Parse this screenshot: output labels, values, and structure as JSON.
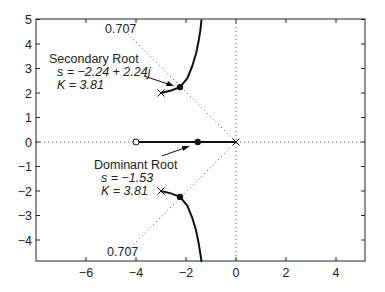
{
  "chart_data": {
    "type": "line",
    "title": "",
    "xlabel": "",
    "ylabel": "",
    "xlim": [
      -8,
      5.2
    ],
    "ylim": [
      -4.9,
      5
    ],
    "grid": false,
    "x_ticks": [
      -6,
      -4,
      -2,
      0,
      2,
      4
    ],
    "x_tick_labels": [
      "−6",
      "−4",
      "−2",
      "0",
      "2",
      "4"
    ],
    "y_ticks": [
      5,
      4,
      3,
      2,
      1,
      0,
      -1,
      -2,
      -3,
      -4
    ],
    "y_tick_labels": [
      "5",
      "4",
      "3",
      "2",
      "1",
      "0",
      "−1",
      "−2",
      "−3",
      "−4"
    ],
    "poles": [
      [
        0,
        0
      ],
      [
        -3,
        2
      ],
      [
        -3,
        -2
      ]
    ],
    "zeros": [
      [
        -4,
        0
      ]
    ],
    "series": [
      {
        "name": "real-axis locus",
        "x": [
          -4,
          0
        ],
        "y": [
          0,
          0
        ]
      },
      {
        "name": "upper complex branch",
        "x": [
          -3.0,
          -2.6,
          -2.24,
          -1.95,
          -1.75,
          -1.6,
          -1.5,
          -1.42,
          -1.38
        ],
        "y": [
          2.0,
          2.1,
          2.24,
          2.6,
          3.1,
          3.6,
          4.1,
          4.6,
          5.0
        ]
      },
      {
        "name": "lower complex branch",
        "x": [
          -3.0,
          -2.6,
          -2.24,
          -1.95,
          -1.75,
          -1.6,
          -1.5,
          -1.42,
          -1.38
        ],
        "y": [
          -2.0,
          -2.1,
          -2.24,
          -2.6,
          -3.1,
          -3.6,
          -4.1,
          -4.6,
          -4.9
        ]
      }
    ],
    "damping_lines": {
      "zeta": 0.707,
      "label": "0.707"
    },
    "marked_roots": [
      [
        -1.53,
        0
      ],
      [
        -2.24,
        2.24
      ],
      [
        -2.24,
        -2.24
      ]
    ],
    "annotations": [
      {
        "title": "Secondary Root",
        "s_line": "s = −2.24 + 2.24j",
        "k_line": "K = 3.81"
      },
      {
        "title": "Dominant Root",
        "s_line": "s = −1.53",
        "k_line": "K = 3.81"
      }
    ]
  },
  "labels": {
    "secondary_title": "Secondary Root",
    "secondary_s": "s = −2.24 + 2.24",
    "secondary_j": "j",
    "secondary_k": "K = 3.81",
    "dominant_title": "Dominant Root",
    "dominant_s": "s = −1.53",
    "dominant_k": "K = 3.81",
    "zeta_top": "0.707",
    "zeta_bottom": "0.707"
  }
}
